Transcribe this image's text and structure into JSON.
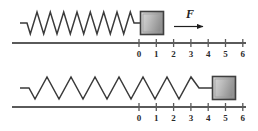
{
  "figure": {
    "background_color": "#ffffff",
    "line_color": "#4a4a4a",
    "spring_color": "#3a3a3a",
    "axis_color": "#5a5a5a",
    "block_fill_light": "#d8d8d8",
    "block_fill_dark": "#8a8a8a",
    "block_border_color": "#3f3f3f",
    "label_color": "#2b2b2b"
  },
  "panels": [
    {
      "id": "top-panel",
      "name": "relaxed-spring-panel",
      "spring": {
        "name": "coil-spring-compressed",
        "state": "relaxed",
        "coil_count": 9,
        "start_x": 20,
        "end_x": 140,
        "center_y": 23,
        "amplitude": 11,
        "stub_length": 7
      },
      "block": {
        "name": "block-top",
        "x": 140,
        "y": 11,
        "width": 24,
        "height": 24,
        "position_on_axis": 0.5
      },
      "force": {
        "label": "F",
        "label_x": 190,
        "label_y": 17,
        "arrow_start_x": 174,
        "arrow_end_x": 206,
        "arrow_y": 26,
        "direction": "right"
      },
      "axis": {
        "name": "axis-top",
        "x_start": 12,
        "x_end": 246,
        "y": 43,
        "tick_start_x": 139,
        "tick_spacing": 17.3,
        "tick_length": 6,
        "labels": [
          "0",
          "1",
          "2",
          "3",
          "4",
          "5",
          "6"
        ],
        "label_y": 56
      }
    },
    {
      "id": "bottom-panel",
      "name": "stretched-spring-panel",
      "spring": {
        "name": "coil-spring-stretched",
        "state": "stretched",
        "coil_count": 8,
        "start_x": 20,
        "end_x": 212,
        "center_y": 88,
        "amplitude": 11,
        "stub_length": 9
      },
      "block": {
        "name": "block-bottom",
        "x": 212,
        "y": 76,
        "width": 24,
        "height": 24,
        "position_on_axis": 5.5
      },
      "axis": {
        "name": "axis-bottom",
        "x_start": 12,
        "x_end": 246,
        "y": 107,
        "tick_start_x": 139,
        "tick_spacing": 17.3,
        "tick_length": 6,
        "labels": [
          "0",
          "1",
          "2",
          "3",
          "4",
          "5",
          "6"
        ],
        "label_y": 120
      }
    }
  ]
}
